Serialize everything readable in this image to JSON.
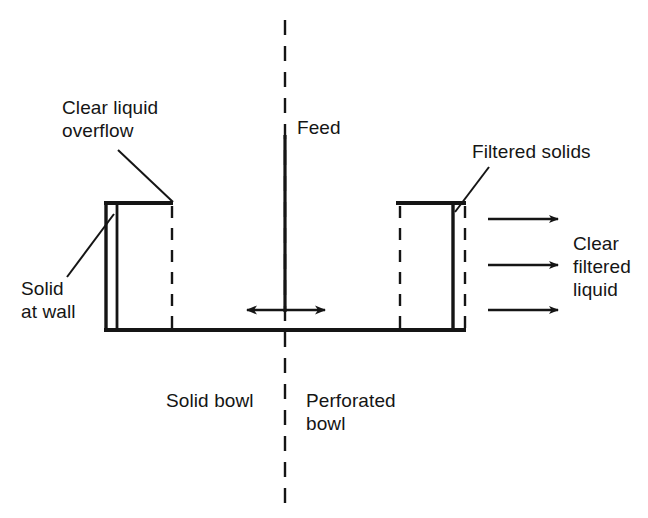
{
  "figure": {
    "type": "process-diagram",
    "background_color": "#ffffff",
    "line_color": "#151515",
    "text_color": "#151515"
  },
  "labels": {
    "clear_liquid_overflow": "Clear liquid\noverflow",
    "solid_at_wall": "Solid\nat wall",
    "feed": "Feed",
    "filtered_solids": "Filtered solids",
    "clear_filtered_liquid": "Clear\nfiltered\nliquid",
    "solid_bowl": "Solid bowl",
    "perforated_bowl": "Perforated\nbowl"
  },
  "geometry": {
    "centerline_x": 285,
    "centerline_y_top": 20,
    "centerline_y_bottom": 505,
    "bowl_bottom_y": 330,
    "bowl_top_y": 203,
    "left_wall_outer_x": 105,
    "left_wall_inner_x": 117,
    "left_dashed_x": 172,
    "right_dashed_inner_x": 400,
    "right_wall_x": 453,
    "right_dashed_outer_x": 465,
    "feed_pipe_top_y": 135,
    "split_arrow_y": 310,
    "split_arrow_left_x": 233,
    "split_arrow_right_x": 337,
    "outflow_arrow_y": [
      219,
      265,
      310
    ],
    "outflow_arrow_x_start": 488,
    "outflow_arrow_x_end": 566
  },
  "annotations": {
    "leader_clear_liquid_overflow": {
      "from_x": 118,
      "from_y": 150,
      "to_x": 172,
      "to_y": 201
    },
    "leader_solid_at_wall": {
      "from_x": 68,
      "from_y": 276,
      "to_x": 113,
      "to_y": 215
    },
    "leader_filtered_solids": {
      "from_x": 487,
      "from_y": 168,
      "to_x": 455,
      "to_y": 212
    }
  }
}
